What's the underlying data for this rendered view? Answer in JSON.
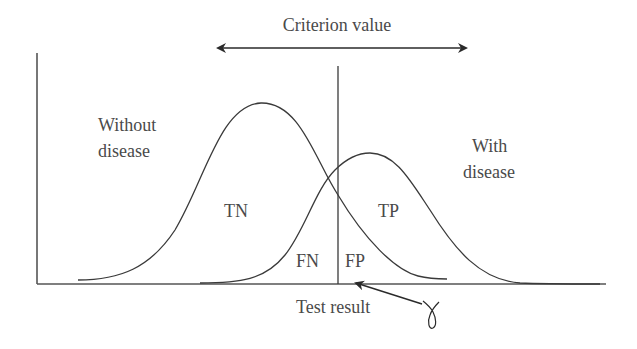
{
  "title": "Criterion value",
  "axis": {
    "x_label": "Test result"
  },
  "distributions": {
    "without_disease": {
      "line1": "Without",
      "line2": "disease"
    },
    "with_disease": {
      "line1": "With",
      "line2": "disease"
    }
  },
  "regions": {
    "tn": "TN",
    "tp": "TP",
    "fn": "FN",
    "fp": "FP"
  },
  "annotation": {
    "handwritten_symbol": "γ"
  },
  "colors": {
    "stroke": "#3a3a3a",
    "text": "#4a4a4a",
    "background": "#ffffff"
  }
}
